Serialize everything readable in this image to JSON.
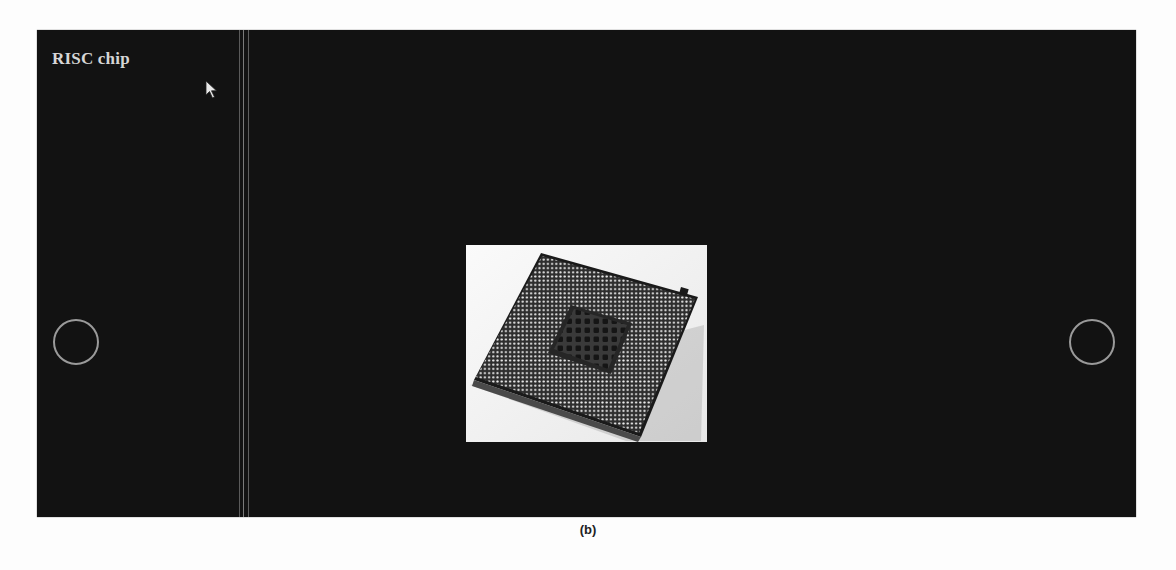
{
  "slideshow": {
    "title": "RISC chip",
    "image": {
      "subject": "cpu-chip-pin-grid",
      "alt": "RISC chip"
    },
    "nav": {
      "prev_icon": "circle-prev-icon",
      "next_icon": "circle-next-icon"
    },
    "colors": {
      "background": "#121212",
      "title": "#d6d6d6",
      "nav_ring": "#9a9a9a"
    }
  },
  "caption": "(b)"
}
